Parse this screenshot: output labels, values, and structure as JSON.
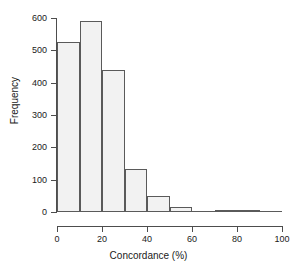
{
  "chart_data": {
    "type": "bar",
    "title": "",
    "subtitle": "",
    "xlabel": "Concordance (%)",
    "ylabel": "Frequency",
    "xlim": [
      0,
      100
    ],
    "ylim": [
      0,
      600
    ],
    "bin_width": 10,
    "grid": false,
    "legend": null,
    "xticks": [
      0,
      20,
      40,
      60,
      80,
      100
    ],
    "xtick_labels": [
      "0",
      "20",
      "40",
      "60",
      "80",
      "100"
    ],
    "yticks": [
      0,
      100,
      200,
      300,
      400,
      500,
      600
    ],
    "ytick_labels": [
      "0",
      "100",
      "200",
      "300",
      "400",
      "500",
      "600"
    ],
    "bin_edges": [
      0,
      10,
      20,
      30,
      40,
      50,
      60,
      70,
      80,
      90,
      100
    ],
    "categories": [
      "0-10",
      "10-20",
      "20-30",
      "30-40",
      "40-50",
      "50-60",
      "60-70",
      "70-80",
      "80-90",
      "90-100"
    ],
    "values": [
      525,
      592,
      438,
      133,
      50,
      16,
      0,
      4,
      5,
      0
    ],
    "bar_fill": "#f2f2f2",
    "bar_stroke": "#5a5a5a",
    "axis_color": "#4d4d4d",
    "background": "#ffffff"
  }
}
